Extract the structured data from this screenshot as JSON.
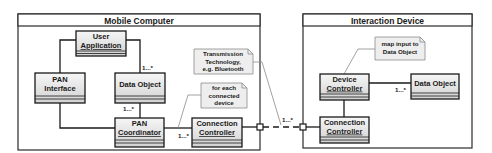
{
  "colors": {
    "line": "#1a1a1a",
    "class_fill_top": "#f4f4f4",
    "class_fill_bottom": "#d6d6d6",
    "note_fill": "#eeeeee",
    "note_border": "#8a8a8a",
    "background": "#ffffff"
  },
  "frames": {
    "mobile_computer": {
      "title": "Mobile Computer"
    },
    "interaction_device": {
      "title": "Interaction Device"
    }
  },
  "classes": {
    "user_application": {
      "line1": "User",
      "line2": "Application"
    },
    "pan_interface": {
      "line1": "PAN",
      "line2": "Interface"
    },
    "data_object_mobile": {
      "line1": "Data Object"
    },
    "pan_coordinator": {
      "line1": "PAN",
      "line2": "Coordinator"
    },
    "connection_controller_mobile": {
      "line1": "Connection",
      "line2": "Controller"
    },
    "device_controller": {
      "line1": "Device",
      "line2": "Controller"
    },
    "data_object_device": {
      "line1": "Data Object"
    },
    "connection_controller_device": {
      "line1": "Connection",
      "line2": "Controller"
    }
  },
  "notes": {
    "transmission": {
      "line1": "Transmission",
      "line2": "Technology,",
      "line3": "e.g. Bluetooth"
    },
    "for_each": {
      "line1": "for each",
      "line2": "connected",
      "line3": "device"
    },
    "map_input": {
      "line1": "map input to",
      "line2": "Data Object"
    }
  },
  "multiplicities": {
    "user_app_to_data_object": "1...*",
    "data_object_to_pan_coordinator": "1...*",
    "pan_coordinator_to_connection_controller": "1...*",
    "port_link": "1...*",
    "device_controller_to_data_object": "1...*"
  }
}
